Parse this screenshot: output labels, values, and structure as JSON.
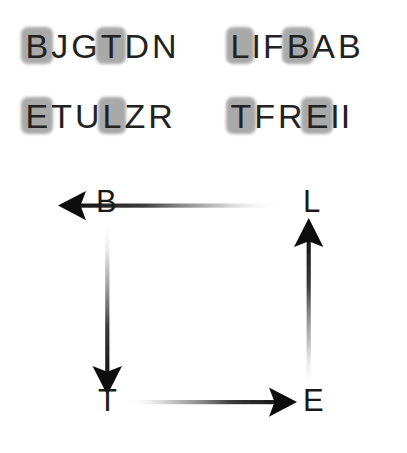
{
  "canvas": {
    "width": 407,
    "height": 453,
    "background": "#ffffff"
  },
  "word_grid": {
    "highlight_color": "#a9a9a9",
    "text_color": "#222222",
    "words": [
      {
        "id": "word-top-left",
        "text": "BJGTDN",
        "letters": [
          "B",
          "J",
          "G",
          "T",
          "D",
          "N"
        ],
        "highlighted_indices": [
          0,
          3
        ],
        "highlighted_letters": [
          "B",
          "T"
        ]
      },
      {
        "id": "word-top-right",
        "text": "LIFBAB",
        "letters": [
          "L",
          "I",
          "F",
          "B",
          "A",
          "B"
        ],
        "highlighted_indices": [
          0,
          3
        ],
        "highlighted_letters": [
          "L",
          "B"
        ]
      },
      {
        "id": "word-bottom-left",
        "text": "ETULZR",
        "letters": [
          "E",
          "T",
          "U",
          "L",
          "Z",
          "R"
        ],
        "highlighted_indices": [
          0,
          3
        ],
        "highlighted_letters": [
          "E",
          "L"
        ]
      },
      {
        "id": "word-bottom-right",
        "text": "TFREII",
        "letters": [
          "T",
          "F",
          "R",
          "E",
          "I",
          "I"
        ],
        "highlighted_indices": [
          0,
          3
        ],
        "highlighted_letters": [
          "T",
          "E"
        ]
      }
    ]
  },
  "cycle_diagram": {
    "arrow_color": "#111111",
    "nodes": [
      {
        "id": "node-b",
        "label": "B",
        "position": "top-left"
      },
      {
        "id": "node-l",
        "label": "L",
        "position": "top-right"
      },
      {
        "id": "node-t",
        "label": "T",
        "position": "bottom-left"
      },
      {
        "id": "node-e",
        "label": "E",
        "position": "bottom-right"
      }
    ],
    "arrows": [
      {
        "id": "arrow-l-to-b",
        "from": "L",
        "to": "B",
        "direction": "left",
        "side": "top"
      },
      {
        "id": "arrow-b-to-t",
        "from": "B",
        "to": "T",
        "direction": "down",
        "side": "left"
      },
      {
        "id": "arrow-t-to-e",
        "from": "T",
        "to": "E",
        "direction": "right",
        "side": "bottom"
      },
      {
        "id": "arrow-e-to-l",
        "from": "E",
        "to": "L",
        "direction": "up",
        "side": "right"
      }
    ],
    "cycle_order": "B → T → E → L → B"
  }
}
